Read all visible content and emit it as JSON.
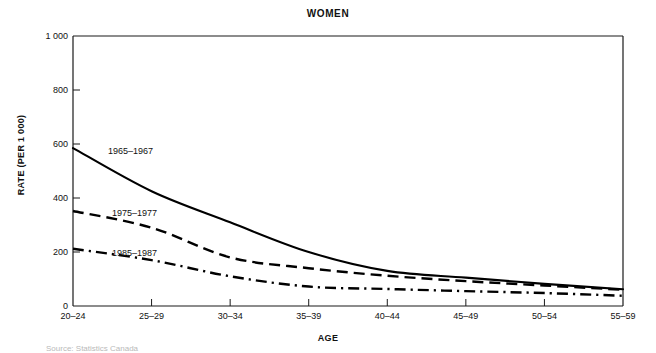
{
  "chart_data": {
    "type": "line",
    "title": "WOMEN",
    "xlabel": "AGE",
    "ylabel": "RATE (PER 1 000)",
    "categories": [
      "20–24",
      "25–29",
      "30–34",
      "35–39",
      "40–44",
      "45–49",
      "50–54",
      "55–59"
    ],
    "ytick_labels": [
      "0",
      "200",
      "400",
      "600",
      "800",
      "1 000"
    ],
    "ytick_values": [
      0,
      200,
      400,
      600,
      800,
      1000
    ],
    "ylim": [
      0,
      1000
    ],
    "grid": false,
    "legend_position": "inline-labels",
    "series": [
      {
        "name": "1965–1967",
        "style": "solid",
        "values": [
          585,
          425,
          310,
          200,
          130,
          105,
          82,
          62
        ]
      },
      {
        "name": "1975–1977",
        "style": "dashed",
        "values": [
          352,
          290,
          180,
          140,
          112,
          92,
          76,
          60
        ]
      },
      {
        "name": "1985–1987",
        "style": "dashdot",
        "values": [
          212,
          170,
          110,
          72,
          63,
          55,
          48,
          38
        ]
      }
    ],
    "annotations": [
      {
        "text": "1965–1967",
        "x": 108,
        "y": 146
      },
      {
        "text": "1975–1977",
        "x": 112,
        "y": 208
      },
      {
        "text": "1985–1987",
        "x": 112,
        "y": 248
      }
    ],
    "axis_color": "#1a1a1a",
    "line_color": "#000000"
  },
  "figure": {
    "caption_partial": "Source: Statistics Canada"
  }
}
